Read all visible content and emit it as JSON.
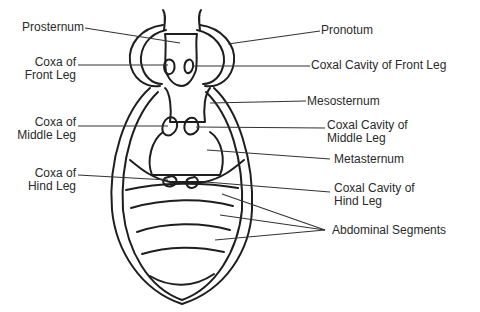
{
  "diagram": {
    "colors": {
      "stroke": "#1e1e1e",
      "leader": "#333333",
      "background": "#ffffff"
    },
    "labels_left": [
      {
        "id": "prosternum",
        "lines": [
          "Prosternum"
        ]
      },
      {
        "id": "coxa-front-leg",
        "lines": [
          "Coxa of",
          "Front Leg"
        ]
      },
      {
        "id": "coxa-middle-leg",
        "lines": [
          "Coxa of",
          "Middle Leg"
        ]
      },
      {
        "id": "coxa-hind-leg",
        "lines": [
          "Coxa of",
          "Hind Leg"
        ]
      }
    ],
    "labels_right": [
      {
        "id": "pronotum",
        "lines": [
          "Pronotum"
        ]
      },
      {
        "id": "coxal-cavity-front-leg",
        "lines": [
          "Coxal Cavity of Front Leg"
        ]
      },
      {
        "id": "mesosternum",
        "lines": [
          "Mesosternum"
        ]
      },
      {
        "id": "coxal-cavity-middle-leg",
        "lines": [
          "Coxal Cavity of",
          "Middle Leg"
        ]
      },
      {
        "id": "metasternum",
        "lines": [
          "Metasternum"
        ]
      },
      {
        "id": "coxal-cavity-hind-leg",
        "lines": [
          "Coxal Cavity of",
          "Hind Leg"
        ]
      },
      {
        "id": "abdominal-segments",
        "lines": [
          "Abdominal Segments"
        ]
      }
    ]
  }
}
